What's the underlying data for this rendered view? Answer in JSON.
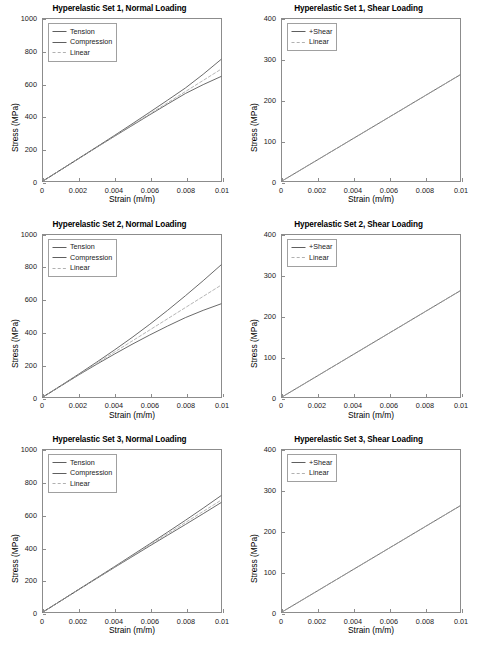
{
  "figure": {
    "background": "#ffffff",
    "frame_color": "#8c8c8c",
    "text_color": "#000000"
  },
  "chart_data": [
    {
      "type": "line",
      "title": "Hyperelastic Set 1, Normal Loading",
      "xlabel": "Strain (m/m)",
      "ylabel": "Stress (MPa)",
      "xlim": [
        0,
        0.01
      ],
      "ylim": [
        0,
        1000
      ],
      "xticks": [
        0,
        0.002,
        0.004,
        0.006,
        0.008,
        0.01
      ],
      "xticklabels": [
        "0",
        "0.002",
        "0.004",
        "0.006",
        "0.008",
        "0.01"
      ],
      "yticks": [
        0,
        200,
        400,
        600,
        800,
        1000
      ],
      "yticklabels": [
        "0",
        "200",
        "400",
        "600",
        "800",
        "1000"
      ],
      "grid": false,
      "legend_position": "upper left",
      "x": [
        0,
        0.001,
        0.002,
        0.003,
        0.004,
        0.005,
        0.006,
        0.007,
        0.008,
        0.009,
        0.01
      ],
      "series": [
        {
          "name": "Tension",
          "style": "solid",
          "color": "#4d4d4d",
          "values": [
            0,
            69,
            139,
            209,
            280,
            352,
            425,
            499,
            574,
            659,
            750
          ]
        },
        {
          "name": "Compression",
          "style": "solid",
          "color": "#4d4d4d",
          "values": [
            0,
            69,
            138,
            207,
            275,
            342,
            409,
            475,
            540,
            595,
            645
          ]
        },
        {
          "name": "Linear",
          "style": "dashed",
          "color": "#a8a8a8",
          "values": [
            0,
            69,
            138,
            207,
            276,
            345,
            414,
            483,
            552,
            621,
            690
          ]
        }
      ]
    },
    {
      "type": "line",
      "title": "Hyperelastic Set 1, Shear Loading",
      "xlabel": "Strain (m/m)",
      "ylabel": "Stress (MPa)",
      "xlim": [
        0,
        0.01
      ],
      "ylim": [
        0,
        400
      ],
      "xticks": [
        0,
        0.002,
        0.004,
        0.006,
        0.008,
        0.01
      ],
      "xticklabels": [
        "0",
        "0.002",
        "0.004",
        "0.006",
        "0.008",
        "0.01"
      ],
      "yticks": [
        0,
        100,
        200,
        300,
        400
      ],
      "yticklabels": [
        "0",
        "100",
        "200",
        "300",
        "400"
      ],
      "grid": false,
      "legend_position": "upper left",
      "x": [
        0,
        0.001,
        0.002,
        0.003,
        0.004,
        0.005,
        0.006,
        0.007,
        0.008,
        0.009,
        0.01
      ],
      "series": [
        {
          "name": "+Shear",
          "style": "solid",
          "color": "#4d4d4d",
          "values": [
            0,
            26.2,
            52.4,
            78.6,
            104.8,
            131,
            157.2,
            183.4,
            209.6,
            235.8,
            262
          ]
        },
        {
          "name": "Linear",
          "style": "dashed",
          "color": "#a8a8a8",
          "values": [
            0,
            26.2,
            52.4,
            78.6,
            104.8,
            131,
            157.2,
            183.4,
            209.6,
            235.8,
            262
          ]
        }
      ]
    },
    {
      "type": "line",
      "title": "Hyperelastic Set 2, Normal Loading",
      "xlabel": "Strain (m/m)",
      "ylabel": "Stress (MPa)",
      "xlim": [
        0,
        0.01
      ],
      "ylim": [
        0,
        1000
      ],
      "xticks": [
        0,
        0.002,
        0.004,
        0.006,
        0.008,
        0.01
      ],
      "xticklabels": [
        "0",
        "0.002",
        "0.004",
        "0.006",
        "0.008",
        "0.01"
      ],
      "yticks": [
        0,
        200,
        400,
        600,
        800,
        1000
      ],
      "yticklabels": [
        "0",
        "200",
        "400",
        "600",
        "800",
        "1000"
      ],
      "grid": false,
      "legend_position": "upper left",
      "x": [
        0,
        0.001,
        0.002,
        0.003,
        0.004,
        0.005,
        0.006,
        0.007,
        0.008,
        0.009,
        0.01
      ],
      "series": [
        {
          "name": "Tension",
          "style": "solid",
          "color": "#4d4d4d",
          "values": [
            0,
            70,
            141,
            214,
            289,
            367,
            449,
            535,
            625,
            718,
            815
          ]
        },
        {
          "name": "Compression",
          "style": "solid",
          "color": "#4d4d4d",
          "values": [
            0,
            68,
            136,
            201,
            264,
            325,
            383,
            438,
            490,
            535,
            575
          ]
        },
        {
          "name": "Linear",
          "style": "dashed",
          "color": "#a8a8a8",
          "values": [
            0,
            69,
            138,
            207,
            276,
            345,
            414,
            483,
            552,
            621,
            690
          ]
        }
      ]
    },
    {
      "type": "line",
      "title": "Hyperelastic Set 2, Shear Loading",
      "xlabel": "Strain (m/m)",
      "ylabel": "Stress (MPa)",
      "xlim": [
        0,
        0.01
      ],
      "ylim": [
        0,
        400
      ],
      "xticks": [
        0,
        0.002,
        0.004,
        0.006,
        0.008,
        0.01
      ],
      "xticklabels": [
        "0",
        "0.002",
        "0.004",
        "0.006",
        "0.008",
        "0.01"
      ],
      "yticks": [
        0,
        100,
        200,
        300,
        400
      ],
      "yticklabels": [
        "0",
        "100",
        "200",
        "300",
        "400"
      ],
      "grid": false,
      "legend_position": "upper left",
      "x": [
        0,
        0.001,
        0.002,
        0.003,
        0.004,
        0.005,
        0.006,
        0.007,
        0.008,
        0.009,
        0.01
      ],
      "series": [
        {
          "name": "+Shear",
          "style": "solid",
          "color": "#4d4d4d",
          "values": [
            0,
            26.2,
            52.4,
            78.6,
            104.8,
            131,
            157.2,
            183.4,
            209.6,
            235.8,
            262
          ]
        },
        {
          "name": "Linear",
          "style": "dashed",
          "color": "#a8a8a8",
          "values": [
            0,
            26.2,
            52.4,
            78.6,
            104.8,
            131,
            157.2,
            183.4,
            209.6,
            235.8,
            262
          ]
        }
      ]
    },
    {
      "type": "line",
      "title": "Hyperelastic Set 3, Normal Loading",
      "xlabel": "Strain (m/m)",
      "ylabel": "Stress (MPa)",
      "xlim": [
        0,
        0.01
      ],
      "ylim": [
        0,
        1000
      ],
      "xticks": [
        0,
        0.002,
        0.004,
        0.006,
        0.008,
        0.01
      ],
      "xticklabels": [
        "0",
        "0.002",
        "0.004",
        "0.006",
        "0.008",
        "0.01"
      ],
      "yticks": [
        0,
        200,
        400,
        600,
        800,
        1000
      ],
      "yticklabels": [
        "0",
        "200",
        "400",
        "600",
        "800",
        "1000"
      ],
      "grid": false,
      "legend_position": "upper left",
      "x": [
        0,
        0.001,
        0.002,
        0.003,
        0.004,
        0.005,
        0.006,
        0.007,
        0.008,
        0.009,
        0.01
      ],
      "series": [
        {
          "name": "Tension",
          "style": "solid",
          "color": "#4d4d4d",
          "values": [
            0,
            69,
            139,
            209,
            279,
            350,
            421,
            493,
            566,
            641,
            718
          ]
        },
        {
          "name": "Compression",
          "style": "solid",
          "color": "#4d4d4d",
          "values": [
            0,
            69,
            138,
            206,
            274,
            341,
            408,
            474,
            540,
            607,
            675
          ]
        },
        {
          "name": "Linear",
          "style": "dashed",
          "color": "#a8a8a8",
          "values": [
            0,
            69,
            138,
            207,
            276,
            345,
            414,
            483,
            552,
            621,
            690
          ]
        }
      ]
    },
    {
      "type": "line",
      "title": "Hyperelastic Set 3, Shear Loading",
      "xlabel": "Strain (m/m)",
      "ylabel": "Stress (MPa)",
      "xlim": [
        0,
        0.01
      ],
      "ylim": [
        0,
        400
      ],
      "xticks": [
        0,
        0.002,
        0.004,
        0.006,
        0.008,
        0.01
      ],
      "xticklabels": [
        "0",
        "0.002",
        "0.004",
        "0.006",
        "0.008",
        "0.01"
      ],
      "yticks": [
        0,
        100,
        200,
        300,
        400
      ],
      "yticklabels": [
        "0",
        "100",
        "200",
        "300",
        "400"
      ],
      "grid": false,
      "legend_position": "upper left",
      "x": [
        0,
        0.001,
        0.002,
        0.003,
        0.004,
        0.005,
        0.006,
        0.007,
        0.008,
        0.009,
        0.01
      ],
      "series": [
        {
          "name": "+Shear",
          "style": "solid",
          "color": "#4d4d4d",
          "values": [
            0,
            26.2,
            52.4,
            78.6,
            104.8,
            131,
            157.2,
            183.4,
            209.6,
            235.8,
            262
          ]
        },
        {
          "name": "Linear",
          "style": "dashed",
          "color": "#a8a8a8",
          "values": [
            0,
            26.2,
            52.4,
            78.6,
            104.8,
            131,
            157.2,
            183.4,
            209.6,
            235.8,
            262
          ]
        }
      ]
    }
  ]
}
